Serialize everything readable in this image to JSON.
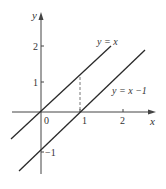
{
  "diagram": {
    "type": "coordinate-graph",
    "axes": {
      "x_label": "x",
      "y_label": "y",
      "origin_label": "0",
      "x_ticks": [
        "1",
        "2"
      ],
      "y_ticks": [
        "2",
        "1",
        "−1"
      ]
    },
    "lines": [
      {
        "name": "y-equals-x",
        "label": "y = x"
      },
      {
        "name": "y-equals-x-minus-1",
        "label": "y = x −1"
      }
    ],
    "dashed_guide": {
      "from": "(1, 1)",
      "to": "(1, 0)"
    },
    "colors": {
      "line": "#2a2a2a",
      "axis": "#444444",
      "text": "#333333",
      "dashed": "#666666"
    }
  }
}
